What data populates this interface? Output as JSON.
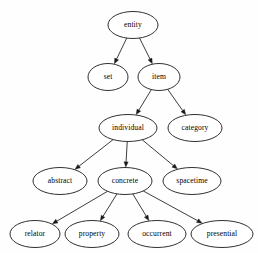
{
  "graph": {
    "title": "entity ontology hierarchy",
    "type": "directed-acyclic-graph",
    "orientation": "top-down",
    "background_color": "#fefefe",
    "node_fill_color": "#ffffff",
    "node_stroke_color": "#1a1a1a",
    "edge_color": "#1a1a1a",
    "label_color": "#000000",
    "nodes": [
      {
        "id": "entity",
        "label": "entity",
        "cx": 133,
        "cy": 25,
        "rx": 25,
        "ry": 13.5,
        "level": 0
      },
      {
        "id": "set",
        "label": "set",
        "cx": 108,
        "cy": 77,
        "rx": 20,
        "ry": 13.5,
        "level": 1
      },
      {
        "id": "item",
        "label": "item",
        "cx": 159,
        "cy": 77,
        "rx": 21,
        "ry": 13.5,
        "level": 1
      },
      {
        "id": "individual",
        "label": "individual",
        "cx": 128,
        "cy": 128,
        "rx": 29,
        "ry": 13.5,
        "level": 2
      },
      {
        "id": "category",
        "label": "category",
        "cx": 195,
        "cy": 128,
        "rx": 27,
        "ry": 13.5,
        "level": 2
      },
      {
        "id": "abstract",
        "label": "abstract",
        "cx": 60,
        "cy": 181,
        "rx": 27,
        "ry": 13.5,
        "level": 3
      },
      {
        "id": "concrete",
        "label": "concrete",
        "cx": 125,
        "cy": 181,
        "rx": 27,
        "ry": 13.5,
        "level": 3
      },
      {
        "id": "spacetime",
        "label": "spacetime",
        "cx": 192,
        "cy": 181,
        "rx": 29,
        "ry": 13.5,
        "level": 3
      },
      {
        "id": "relator",
        "label": "relator",
        "cx": 35,
        "cy": 234,
        "rx": 25,
        "ry": 13.5,
        "level": 4
      },
      {
        "id": "property",
        "label": "property",
        "cx": 92,
        "cy": 234,
        "rx": 27,
        "ry": 13.5,
        "level": 4
      },
      {
        "id": "occurrent",
        "label": "occurrent",
        "cx": 157,
        "cy": 234,
        "rx": 29,
        "ry": 13.5,
        "level": 4
      },
      {
        "id": "presential",
        "label": "presential",
        "cx": 222,
        "cy": 234,
        "rx": 31,
        "ry": 13.5,
        "level": 4
      }
    ],
    "edges": [
      {
        "from": "entity",
        "to": "set",
        "arrow": "filled"
      },
      {
        "from": "entity",
        "to": "item",
        "arrow": "filled"
      },
      {
        "from": "item",
        "to": "individual",
        "arrow": "filled"
      },
      {
        "from": "item",
        "to": "category",
        "arrow": "filled"
      },
      {
        "from": "individual",
        "to": "abstract",
        "arrow": "filled"
      },
      {
        "from": "individual",
        "to": "concrete",
        "arrow": "filled"
      },
      {
        "from": "individual",
        "to": "spacetime",
        "arrow": "filled"
      },
      {
        "from": "concrete",
        "to": "relator",
        "arrow": "filled"
      },
      {
        "from": "concrete",
        "to": "property",
        "arrow": "filled"
      },
      {
        "from": "concrete",
        "to": "occurrent",
        "arrow": "filled"
      },
      {
        "from": "concrete",
        "to": "presential",
        "arrow": "filled"
      }
    ]
  }
}
